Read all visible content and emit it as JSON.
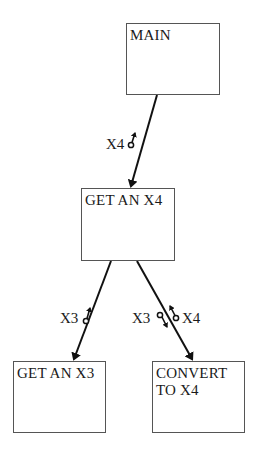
{
  "diagram": {
    "type": "structure-chart",
    "modules": [
      {
        "id": "main",
        "label": "MAIN"
      },
      {
        "id": "get_an_x4",
        "label": "GET AN X4"
      },
      {
        "id": "get_an_x3",
        "label": "GET AN X3"
      },
      {
        "id": "convert_to_x4",
        "label": "CONVERT\nTO X4"
      }
    ],
    "calls": [
      {
        "from": "main",
        "to": "get_an_x4"
      },
      {
        "from": "get_an_x4",
        "to": "get_an_x3"
      },
      {
        "from": "get_an_x4",
        "to": "convert_to_x4"
      }
    ],
    "couples": [
      {
        "label": "X4",
        "call": "main->get_an_x4",
        "direction": "up"
      },
      {
        "label": "X3",
        "call": "get_an_x4->get_an_x3",
        "direction": "up"
      },
      {
        "label": "X3",
        "call": "get_an_x4->convert_to_x4",
        "direction": "down"
      },
      {
        "label": "X4",
        "call": "get_an_x4->convert_to_x4",
        "direction": "up"
      }
    ],
    "colors": {
      "line": "#111111",
      "box_border": "#555555",
      "text": "#1a1a1a"
    }
  }
}
